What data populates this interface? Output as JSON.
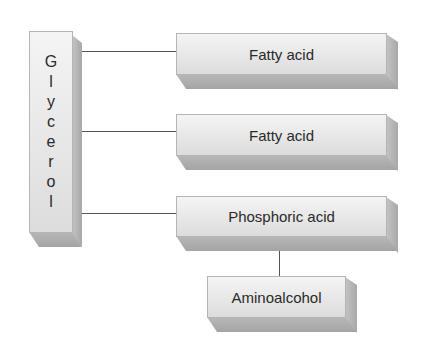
{
  "diagram": {
    "backbone": {
      "label": "Glycerol",
      "letters": [
        "G",
        "l",
        "y",
        "c",
        "e",
        "r",
        "o",
        "l"
      ]
    },
    "components": [
      {
        "label": "Fatty acid"
      },
      {
        "label": "Fatty acid"
      },
      {
        "label": "Phosphoric acid"
      },
      {
        "label": "Aminoalcohol"
      }
    ],
    "colors": {
      "box_face": "#e8e8e8",
      "box_shadow": "#a8a8a8",
      "line": "#555555",
      "text": "#2a2a2a"
    }
  }
}
